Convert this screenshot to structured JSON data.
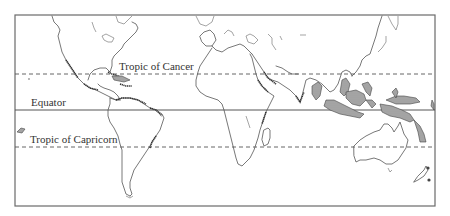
{
  "map": {
    "type": "world-coastline-map",
    "lines": [
      {
        "id": "tropic-of-cancer",
        "label": "Tropic of Cancer",
        "latitude": 23.5,
        "style": "dashed"
      },
      {
        "id": "equator",
        "label": "Equator",
        "latitude": 0,
        "style": "solid"
      },
      {
        "id": "tropic-of-capricorn",
        "label": "Tropic of Capricorn",
        "latitude": -23.5,
        "style": "dashed"
      }
    ],
    "shaded_regions_description": "Hatched coastal zones in tropical regions (Central America, Caribbean, northern South America, East Africa, Red Sea, India, Southeast Asia, Indonesia, New Guinea, northern Australia, Pacific islands)",
    "colors": {
      "line": "#555555",
      "hatch": "#333333",
      "background": "#ffffff"
    }
  }
}
